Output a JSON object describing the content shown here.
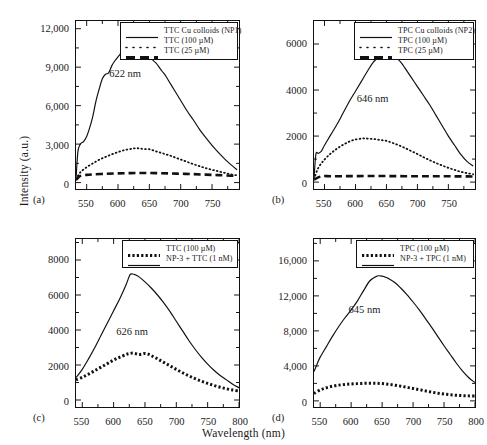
{
  "figure": {
    "xlabel": "Wavelength (nm)",
    "ylabel": "Intensity (a.u.)"
  },
  "chart_data": [
    {
      "type": "line",
      "panel": "(a)",
      "title": "",
      "xlabel": "Wavelength (nm)",
      "ylabel": "Intensity (a.u.)",
      "xlim": [
        533,
        793
      ],
      "ylim": [
        -500,
        12600
      ],
      "xticks": [
        550,
        600,
        650,
        700,
        750
      ],
      "yticks": [
        0,
        3000,
        6000,
        9000,
        12000
      ],
      "ytick_labels": [
        "0",
        "3,000",
        "6,000",
        "9,000",
        "12,000"
      ],
      "xtick_labels": [
        "550",
        "600",
        "650",
        "700",
        "750"
      ],
      "annotation": "622 nm",
      "annotation_x": 612,
      "annotation_y": 8500,
      "grid": false,
      "legend_position": "top-right",
      "series": [
        {
          "name": "TTC Cu colloids (NP1)",
          "style": "solid",
          "x": [
            533,
            536,
            540,
            545,
            550,
            555,
            560,
            565,
            570,
            575,
            580,
            585,
            590,
            595,
            600,
            605,
            610,
            615,
            620,
            622,
            625,
            630,
            635,
            640,
            645,
            650,
            655,
            660,
            665,
            670,
            675,
            680,
            690,
            700,
            710,
            720,
            730,
            740,
            750,
            760,
            770,
            780,
            790
          ],
          "values": [
            250,
            2400,
            3000,
            3200,
            3600,
            4300,
            5200,
            6400,
            7300,
            8100,
            8450,
            8550,
            9100,
            9500,
            9800,
            10100,
            10400,
            10600,
            10700,
            10750,
            10600,
            10450,
            10250,
            10350,
            10200,
            10150,
            9600,
            9350,
            9050,
            8700,
            8400,
            8000,
            7200,
            6400,
            5600,
            4900,
            4150,
            3500,
            2900,
            2350,
            1850,
            1400,
            1000
          ]
        },
        {
          "name": "TTC (100 µM)",
          "style": "dotted",
          "x": [
            533,
            540,
            550,
            560,
            570,
            580,
            590,
            600,
            610,
            620,
            625,
            630,
            635,
            640,
            650,
            660,
            670,
            680,
            690,
            700,
            710,
            720,
            730,
            740,
            750,
            760,
            770,
            780,
            790
          ],
          "values": [
            260,
            800,
            1200,
            1500,
            1780,
            2000,
            2200,
            2380,
            2530,
            2620,
            2660,
            2680,
            2660,
            2620,
            2600,
            2450,
            2300,
            2150,
            1980,
            1800,
            1620,
            1440,
            1280,
            1130,
            1000,
            880,
            760,
            650,
            560
          ]
        },
        {
          "name": "TTC (25 µM)",
          "style": "dashed",
          "x": [
            533,
            540,
            550,
            560,
            580,
            600,
            620,
            640,
            660,
            680,
            700,
            720,
            740,
            760,
            780,
            790
          ],
          "values": [
            200,
            520,
            600,
            640,
            690,
            720,
            740,
            750,
            740,
            720,
            690,
            660,
            620,
            580,
            540,
            520
          ]
        }
      ]
    },
    {
      "type": "line",
      "panel": "(b)",
      "title": "",
      "xlabel": "Wavelength (nm)",
      "ylabel": "Intensity (a.u.)",
      "xlim": [
        533,
        793
      ],
      "ylim": [
        -300,
        7000
      ],
      "xticks": [
        550,
        600,
        650,
        700,
        750
      ],
      "yticks": [
        0,
        2000,
        4000,
        6000
      ],
      "ytick_labels": [
        "0",
        "2000",
        "4000",
        "6000"
      ],
      "xtick_labels": [
        "550",
        "600",
        "650",
        "700",
        "750"
      ],
      "annotation": "646 nm",
      "annotation_x": 628,
      "annotation_y": 3650,
      "grid": false,
      "legend_position": "top-right",
      "series": [
        {
          "name": "TPC Cu colloids (NP2)",
          "style": "solid",
          "x": [
            533,
            536,
            540,
            545,
            550,
            560,
            570,
            580,
            590,
            600,
            610,
            620,
            630,
            640,
            646,
            650,
            655,
            660,
            665,
            670,
            675,
            680,
            690,
            700,
            710,
            720,
            730,
            740,
            750,
            760,
            770,
            780,
            790
          ],
          "values": [
            120,
            1200,
            1250,
            1350,
            1600,
            2050,
            2500,
            3000,
            3500,
            3950,
            4400,
            4850,
            5250,
            5450,
            5520,
            5500,
            5450,
            5420,
            5380,
            5300,
            5150,
            4950,
            4550,
            4150,
            3750,
            3350,
            2900,
            2450,
            2000,
            1600,
            1200,
            900,
            700
          ]
        },
        {
          "name": "TPC (100 µM)",
          "style": "dotted",
          "x": [
            533,
            540,
            550,
            560,
            570,
            580,
            590,
            600,
            610,
            615,
            620,
            630,
            640,
            650,
            660,
            670,
            680,
            690,
            700,
            710,
            720,
            730,
            740,
            750,
            760,
            770,
            780,
            790
          ],
          "values": [
            130,
            620,
            980,
            1240,
            1450,
            1620,
            1760,
            1850,
            1890,
            1900,
            1890,
            1870,
            1830,
            1790,
            1700,
            1600,
            1480,
            1350,
            1220,
            1080,
            950,
            830,
            720,
            620,
            530,
            450,
            390,
            340
          ]
        },
        {
          "name": "TPC (25 µM)",
          "style": "dashed",
          "x": [
            533,
            545,
            560,
            580,
            600,
            620,
            640,
            660,
            680,
            700,
            720,
            740,
            760,
            780,
            790
          ],
          "values": [
            110,
            250,
            255,
            258,
            260,
            262,
            262,
            260,
            258,
            256,
            254,
            252,
            250,
            248,
            246
          ]
        }
      ]
    },
    {
      "type": "line",
      "panel": "(c)",
      "title": "",
      "xlabel": "Wavelength (nm)",
      "ylabel": "Intensity (a.u.)",
      "xlim": [
        540,
        800
      ],
      "ylim": [
        -400,
        9200
      ],
      "xticks": [
        550,
        600,
        650,
        700,
        750,
        800
      ],
      "yticks": [
        0,
        2000,
        4000,
        6000,
        8000
      ],
      "ytick_labels": [
        "0",
        "2000",
        "4000",
        "6000",
        "8000"
      ],
      "xtick_labels": [
        "550",
        "600",
        "650",
        "700",
        "750",
        "800"
      ],
      "annotation": "626 nm",
      "annotation_x": 630,
      "annotation_y": 3950,
      "grid": false,
      "legend_position": "top-right",
      "series": [
        {
          "name": "TTC (100 µM)",
          "style": "dotted-thick",
          "x": [
            540,
            550,
            560,
            570,
            580,
            590,
            600,
            610,
            620,
            625,
            630,
            635,
            640,
            645,
            650,
            655,
            660,
            670,
            680,
            690,
            700,
            710,
            720,
            730,
            740,
            750,
            760,
            770,
            780,
            790,
            800
          ],
          "values": [
            1150,
            1300,
            1480,
            1680,
            1880,
            2080,
            2280,
            2450,
            2600,
            2650,
            2680,
            2650,
            2600,
            2620,
            2660,
            2620,
            2540,
            2350,
            2150,
            1950,
            1750,
            1560,
            1380,
            1220,
            1080,
            950,
            830,
            730,
            640,
            570,
            510
          ]
        },
        {
          "name": "NP-3 + TTC (1 nM)",
          "style": "solid",
          "x": [
            540,
            550,
            560,
            570,
            580,
            590,
            600,
            610,
            620,
            626,
            630,
            635,
            640,
            650,
            660,
            670,
            680,
            690,
            700,
            710,
            720,
            730,
            740,
            750,
            760,
            770,
            780,
            790,
            800
          ],
          "values": [
            1280,
            1750,
            2350,
            3000,
            3700,
            4400,
            5100,
            5800,
            6600,
            7150,
            7200,
            7150,
            7050,
            6750,
            6400,
            6000,
            5550,
            5050,
            4500,
            3950,
            3400,
            2900,
            2450,
            2050,
            1700,
            1400,
            1150,
            900,
            700
          ]
        }
      ]
    },
    {
      "type": "line",
      "panel": "(d)",
      "title": "",
      "xlabel": "Wavelength (nm)",
      "ylabel": "Intensity (a.u.)",
      "xlim": [
        540,
        800
      ],
      "ylim": [
        -700,
        18500
      ],
      "xticks": [
        550,
        600,
        650,
        700,
        750,
        800
      ],
      "yticks": [
        0,
        4000,
        8000,
        12000,
        16000
      ],
      "ytick_labels": [
        "0",
        "4,000",
        "8,000",
        "12,000",
        "16,000"
      ],
      "xtick_labels": [
        "550",
        "600",
        "650",
        "700",
        "750",
        "800"
      ],
      "annotation": "645 nm",
      "annotation_x": 622,
      "annotation_y": 10500,
      "grid": false,
      "legend_position": "top-right",
      "series": [
        {
          "name": "TPC (100 µM)",
          "style": "dotted-thick",
          "x": [
            540,
            550,
            560,
            570,
            580,
            590,
            600,
            610,
            620,
            630,
            640,
            650,
            660,
            670,
            680,
            690,
            700,
            710,
            720,
            730,
            740,
            750,
            760,
            770,
            780,
            790,
            800
          ],
          "values": [
            850,
            1250,
            1500,
            1680,
            1800,
            1880,
            1930,
            1970,
            2000,
            2020,
            2010,
            1980,
            1900,
            1800,
            1680,
            1550,
            1420,
            1280,
            1140,
            1000,
            880,
            780,
            700,
            640,
            600,
            570,
            550
          ]
        },
        {
          "name": "NP-3 + TPC (1 nM)",
          "style": "solid",
          "x": [
            540,
            545,
            550,
            560,
            570,
            580,
            590,
            600,
            610,
            620,
            630,
            640,
            645,
            650,
            655,
            660,
            670,
            680,
            690,
            700,
            710,
            720,
            730,
            740,
            750,
            760,
            770,
            780,
            790,
            800
          ],
          "values": [
            3350,
            4200,
            5000,
            6200,
            7400,
            8500,
            9500,
            10400,
            11400,
            12600,
            13700,
            14200,
            14300,
            14250,
            14150,
            14000,
            13550,
            12900,
            12150,
            11300,
            10400,
            9400,
            8400,
            7350,
            6300,
            5300,
            4300,
            3400,
            2650,
            2100
          ]
        }
      ]
    }
  ]
}
